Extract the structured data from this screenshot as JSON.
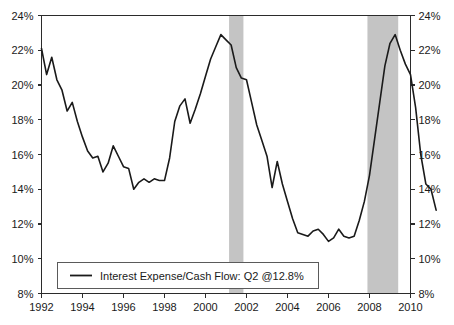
{
  "chart_data": {
    "type": "line",
    "title": "",
    "xlabel": "",
    "ylabel": "",
    "ylim": [
      8,
      24
    ],
    "xlim": [
      1992.0,
      1992.0
    ],
    "y_tick_labels": [
      "8%",
      "10%",
      "12%",
      "14%",
      "16%",
      "18%",
      "20%",
      "22%",
      "24%"
    ],
    "y_ticks": [
      8,
      10,
      12,
      14,
      16,
      18,
      20,
      22,
      24
    ],
    "x_tick_labels": [
      "1992",
      "1994",
      "1996",
      "1998",
      "2000",
      "2002",
      "2004",
      "2006",
      "2008",
      "2010"
    ],
    "x_ticks": [
      1992,
      1994,
      1996,
      1998,
      2000,
      2002,
      2004,
      2006,
      2008,
      2010
    ],
    "y_axis_right_labels": [
      "8%",
      "10%",
      "12%",
      "14%",
      "16%",
      "18%",
      "20%",
      "22%",
      "24%"
    ],
    "grid": false,
    "legend_position": "bottom-left-inside",
    "series": [
      {
        "name": "Interest Expense/Cash Flow: Q2 @12.8%",
        "color": "#1a1a1a",
        "x": [
          1992.0,
          1992.25,
          1992.5,
          1992.75,
          1993.0,
          1993.25,
          1993.5,
          1993.75,
          1994.0,
          1994.25,
          1994.5,
          1994.75,
          1995.0,
          1995.25,
          1995.5,
          1995.75,
          1996.0,
          1996.25,
          1996.5,
          1996.75,
          1997.0,
          1997.25,
          1997.5,
          1997.75,
          1998.0,
          1998.25,
          1998.5,
          1998.75,
          1999.0,
          1999.25,
          1999.5,
          1999.75,
          2000.0,
          2000.25,
          2000.5,
          2000.75,
          2001.0,
          2001.25,
          2001.5,
          2001.75,
          2002.0,
          2002.25,
          2002.5,
          2002.75,
          2003.0,
          2003.25,
          2003.5,
          2003.75,
          2004.0,
          2004.25,
          2004.5,
          2004.75,
          2005.0,
          2005.25,
          2005.5,
          2005.75,
          2006.0,
          2006.25,
          2006.5,
          2006.75,
          2007.0,
          2007.25,
          2007.5,
          2007.75,
          2008.0,
          2008.25,
          2008.5,
          2008.75,
          2009.0,
          2009.25,
          2009.5,
          2009.75,
          2010.0,
          2010.25
        ],
        "values": [
          22.1,
          20.6,
          21.6,
          20.3,
          19.7,
          18.5,
          19.0,
          17.9,
          17.0,
          16.2,
          15.8,
          15.9,
          15.0,
          15.5,
          16.5,
          15.9,
          15.3,
          15.2,
          14.0,
          14.4,
          14.6,
          14.4,
          14.6,
          14.5,
          14.5,
          15.8,
          17.9,
          18.8,
          19.2,
          17.8,
          18.6,
          19.5,
          20.5,
          21.5,
          22.2,
          22.9,
          22.6,
          22.3,
          21.0,
          20.4,
          20.3,
          19.0,
          17.7,
          16.8,
          15.9,
          14.1,
          15.6,
          14.3,
          13.3,
          12.3,
          11.5,
          11.4,
          11.3,
          11.6,
          11.7,
          11.4,
          11.0,
          11.2,
          11.7,
          11.3,
          11.2,
          11.3,
          12.2,
          13.3,
          14.8,
          16.9,
          19.0,
          21.1,
          22.4,
          22.9,
          22.0,
          21.2,
          20.6,
          18.7
        ]
      }
    ],
    "shaded_regions": [
      {
        "name": "recession-2001",
        "x_start": 2001.15,
        "x_end": 2001.85,
        "color": "#c4c4c4"
      },
      {
        "name": "recession-2008",
        "x_start": 2007.9,
        "x_end": 2009.4,
        "color": "#c4c4c4"
      }
    ],
    "tail_values": [
      16.0,
      14.3,
      14.0,
      12.8
    ],
    "legend": {
      "entries": [
        {
          "label": "Interest Expense/Cash Flow: Q2 @12.8%",
          "color": "#1a1a1a"
        }
      ]
    },
    "annotations": {
      "latest_period": "Q2",
      "latest_value": "12.8%"
    }
  },
  "colors": {
    "line": "#1a1a1a",
    "axis": "#2b2b2b",
    "band": "#c4c4c4",
    "text": "#1a1a1a",
    "legend_border": "#5a5a5a",
    "background": "#ffffff"
  }
}
